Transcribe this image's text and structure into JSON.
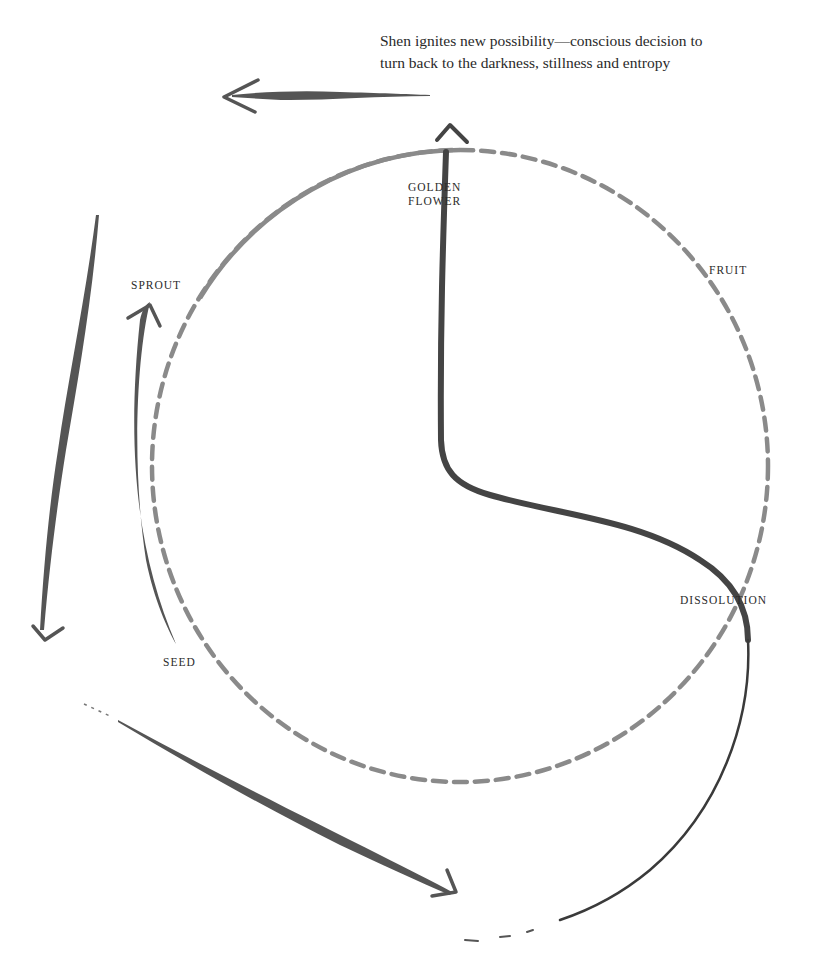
{
  "caption": {
    "line1": "Shen ignites new possibility—conscious decision to",
    "line2": "turn back to the darkness, stillness and entropy"
  },
  "stages": {
    "golden_flower": {
      "line1": "GOLDEN",
      "line2": "FLOWER"
    },
    "sprout": {
      "label": "SPROUT"
    },
    "fruit": {
      "label": "FRUIT"
    },
    "dissolution": {
      "label": "DISSOLUTION"
    },
    "seed": {
      "label": "SEED"
    }
  },
  "colors": {
    "cycle_circle": "#8a8a8a",
    "brush_stroke": "#4a4a4a",
    "text": "#2b2b2b",
    "background": "#ffffff"
  }
}
